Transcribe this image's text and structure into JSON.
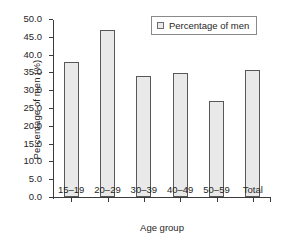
{
  "chart_data": {
    "type": "bar",
    "title": "",
    "subtitle": "",
    "xlabel": "Age group",
    "ylabel": "Percentage of men (%)",
    "categories": [
      "15–19",
      "20–29",
      "30–39",
      "40–49",
      "50–59",
      "Total"
    ],
    "series": [
      {
        "name": "Percentage of men",
        "values": [
          38.0,
          46.8,
          34.0,
          34.8,
          27.1,
          35.7
        ]
      }
    ],
    "values": [
      38.0,
      46.8,
      34.0,
      34.8,
      27.1,
      35.7
    ],
    "ylim": [
      0.0,
      50.0
    ],
    "ytick_step": 5.0,
    "ytick_labels": [
      "0.0",
      "5.0",
      "10.0",
      "15.0",
      "20.0",
      "25.0",
      "30.0",
      "35.0",
      "40.0",
      "45.0",
      "50.0"
    ],
    "ytick_values": [
      0.0,
      5.0,
      10.0,
      15.0,
      20.0,
      25.0,
      30.0,
      35.0,
      40.0,
      45.0,
      50.0
    ],
    "grid": false,
    "legend_position": "top-right",
    "legend_entries": [
      "Percentage of men"
    ],
    "bar_fill_color": "#e9e9e9",
    "bar_border_color": "#585858",
    "axis_color": "#3b3b3b",
    "text_color": "#262626",
    "background_color": "#ffffff"
  },
  "legend": {
    "label": "Percentage of men",
    "swatch_name": "legend-swatch-percentage-of-men"
  },
  "axes": {
    "x_title": "Age group",
    "y_title": "Percentage of men (%)"
  }
}
